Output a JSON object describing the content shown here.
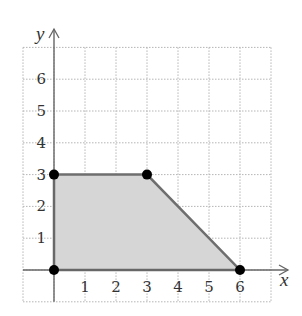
{
  "chart_data": {
    "type": "area",
    "title": "",
    "xlabel": "x",
    "ylabel": "y",
    "xlim": [
      -1,
      7
    ],
    "ylim": [
      -1,
      7
    ],
    "grid": true,
    "grid_style": "dotted",
    "x_ticks": [
      "1",
      "2",
      "3",
      "4",
      "5",
      "6"
    ],
    "y_ticks": [
      "1",
      "2",
      "3",
      "4",
      "5",
      "6"
    ],
    "region": {
      "name": "feasible region",
      "fill": "#d6d6d6",
      "stroke": "#777777",
      "vertices": [
        [
          0,
          0
        ],
        [
          0,
          3
        ],
        [
          3,
          3
        ],
        [
          6,
          0
        ]
      ]
    },
    "points": [
      {
        "x": 0,
        "y": 0
      },
      {
        "x": 0,
        "y": 3
      },
      {
        "x": 3,
        "y": 3
      },
      {
        "x": 6,
        "y": 0
      }
    ],
    "legend": null
  },
  "colors": {
    "grid": "#b5b5b5",
    "axis": "#666666",
    "region_fill": "#d6d6d6",
    "region_edge": "#6e6e6e",
    "point": "#000000",
    "text": "#333333"
  }
}
